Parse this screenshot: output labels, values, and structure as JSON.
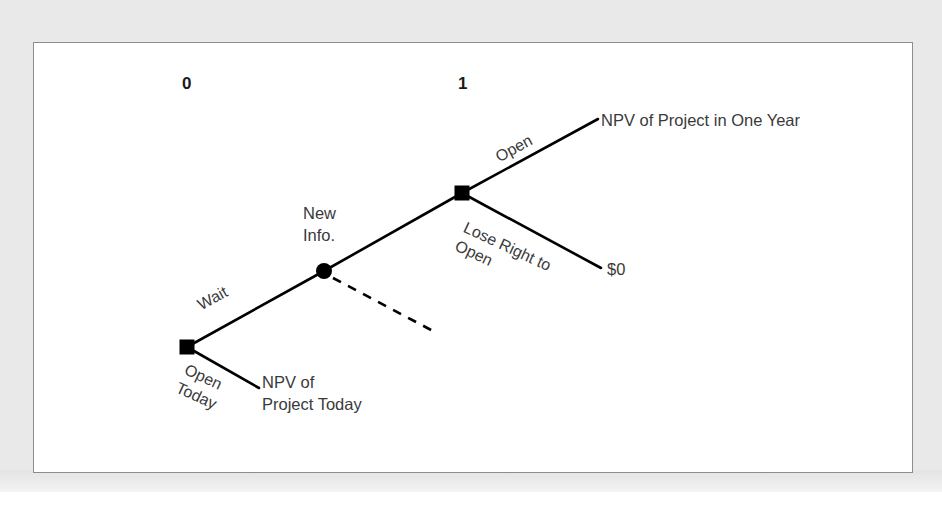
{
  "figure": {
    "kind": "decision-tree",
    "panel_background": "#ffffff",
    "mat_background": "#e9e9e9",
    "border_color": "#8d8d8d",
    "ink_color": "#000000",
    "text_color": "#3a3a3a"
  },
  "timeline": {
    "labels": [
      {
        "text": "0",
        "x": 182,
        "y": 74
      },
      {
        "text": "1",
        "x": 458,
        "y": 74
      }
    ]
  },
  "nodes": [
    {
      "id": "root-decision",
      "shape": "square",
      "name": "open-today-or-wait-decision-node",
      "x": 187,
      "y": 347,
      "size": 15
    },
    {
      "id": "chance-new-info",
      "shape": "circle",
      "name": "new-information-chance-node",
      "x": 324,
      "y": 271,
      "size": 15,
      "label_lines": [
        "New",
        "Info."
      ],
      "label_x": 303,
      "label_y": 203
    },
    {
      "id": "year1-decision",
      "shape": "square",
      "name": "open-in-one-year-decision-node",
      "x": 462,
      "y": 193,
      "size": 15
    }
  ],
  "branches": [
    {
      "id": "wait",
      "label": "Wait",
      "style": "solid",
      "from": "root-decision",
      "to": "chance-new-info",
      "x1": 187,
      "y1": 347,
      "x2": 324,
      "y2": 271,
      "label_x": 198,
      "label_y": 303,
      "rotation": "up"
    },
    {
      "id": "open-today",
      "label_lines": [
        "Open",
        "Today"
      ],
      "style": "solid",
      "from": "root-decision",
      "to": "npv-project-today",
      "x1": 187,
      "y1": 347,
      "x2": 258,
      "y2": 387,
      "label_x": 180,
      "label_y": 360,
      "rotation": "down"
    },
    {
      "id": "wait-alt-dashed",
      "label": "",
      "style": "dashed",
      "from": "chance-new-info",
      "to": null,
      "x1": 332,
      "y1": 277,
      "x2": 432,
      "y2": 330
    },
    {
      "id": "chance-to-decision",
      "label": "",
      "style": "solid",
      "from": "chance-new-info",
      "to": "year1-decision",
      "x1": 324,
      "y1": 271,
      "x2": 462,
      "y2": 193
    },
    {
      "id": "open",
      "label": "Open",
      "style": "solid",
      "from": "year1-decision",
      "to": "npv-project-one-year",
      "x1": 462,
      "y1": 193,
      "x2": 597,
      "y2": 119,
      "label_x": 496,
      "label_y": 155,
      "rotation": "up"
    },
    {
      "id": "lose-right-to-open",
      "label_lines": [
        "Lose Right to",
        "Open"
      ],
      "style": "solid",
      "from": "year1-decision",
      "to": "zero-payoff",
      "x1": 462,
      "y1": 193,
      "x2": 600,
      "y2": 268,
      "label_x": 458,
      "label_y": 218,
      "rotation": "down"
    }
  ],
  "payoffs": [
    {
      "id": "npv-project-one-year",
      "lines": [
        "NPV of Project in One Year"
      ],
      "x": 601,
      "y": 112
    },
    {
      "id": "zero-payoff",
      "lines": [
        "$0"
      ],
      "x": 607,
      "y": 260
    },
    {
      "id": "npv-project-today",
      "lines": [
        "NPV of",
        "Project Today"
      ],
      "x": 262,
      "y": 373
    }
  ],
  "text": {
    "period_0": "0",
    "period_1": "1",
    "new_info_line1": "New",
    "new_info_line2": "Info.",
    "wait": "Wait",
    "open_today_line1": "Open",
    "open_today_line2": "Today",
    "open": "Open",
    "lose_right_line1": "Lose Right to",
    "lose_right_line2": "Open",
    "npv_one_year": "NPV of Project in One Year",
    "zero": "$0",
    "npv_today_line1": "NPV of",
    "npv_today_line2": "Project Today"
  }
}
